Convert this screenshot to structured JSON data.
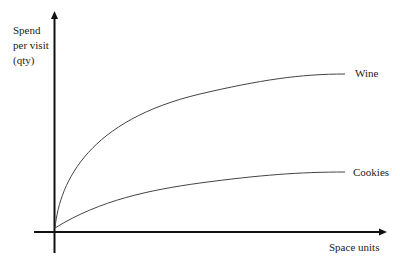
{
  "chart_data": {
    "type": "line",
    "title": "",
    "xlabel": "Space units",
    "ylabel": "Spend per visit (qty)",
    "ylabel_lines": [
      "Spend",
      "per visit",
      "(qty)"
    ],
    "grid": false,
    "ticks": false,
    "legend_position": "inline-right",
    "series": [
      {
        "name": "Wine",
        "shape": "concave, rapid initial rise then plateau at high level",
        "path_px": "M55,228 C60,180 90,120 200,94 C260,80 300,74 345,74"
      },
      {
        "name": "Cookies",
        "shape": "concave, gentle rise then plateau at low level",
        "path_px": "M55,228 C100,200 150,190 200,183 C260,175 300,172 345,172"
      }
    ]
  },
  "labels": {
    "y_line1": "Spend",
    "y_line2": "per visit",
    "y_line3": "(qty)",
    "x_axis": "Space units",
    "wine": "Wine",
    "cookies": "Cookies"
  }
}
